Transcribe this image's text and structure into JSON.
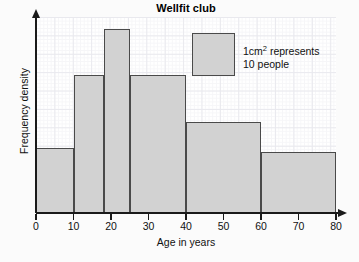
{
  "chart_data": {
    "type": "bar",
    "title": "Wellfit club",
    "xlabel": "Age in years",
    "ylabel": "Frequency density",
    "xlim": [
      0,
      80
    ],
    "ylim": [
      0,
      4.2
    ],
    "grid": true,
    "legend_position": "top-right",
    "xticks": [
      0,
      10,
      20,
      30,
      40,
      50,
      60,
      70,
      80
    ],
    "xtick_labels": [
      "0",
      "10",
      "20",
      "30",
      "40",
      "50",
      "60",
      "70",
      "80"
    ],
    "yticks": [],
    "ytick_labels": [],
    "bin_edges": [
      0,
      10,
      18,
      25,
      40,
      60,
      80
    ],
    "bin_labels": [
      "0-10",
      "10-18",
      "18-25",
      "25-40",
      "40-60",
      "60-80"
    ],
    "frequency_density": [
      1.4,
      2.95,
      3.95,
      2.95,
      1.95,
      1.3
    ],
    "bars": [
      {
        "start": 0,
        "end": 10,
        "density": 1.4
      },
      {
        "start": 10,
        "end": 18,
        "density": 2.95
      },
      {
        "start": 18,
        "end": 25,
        "density": 3.95
      },
      {
        "start": 25,
        "end": 40,
        "density": 2.95
      },
      {
        "start": 40,
        "end": 60,
        "density": 1.95
      },
      {
        "start": 60,
        "end": 80,
        "density": 1.3
      }
    ],
    "bar_fill_color": "#d2d2d2",
    "bar_edge_color": "#4a4a4a",
    "axis_color": "#1a1a1a",
    "grid_color": "#e9e9ee",
    "annotations": [
      "1cm2 represents 10 people"
    ]
  },
  "legend": {
    "line1_prefix": "1cm",
    "line1_sup": "2",
    "line1_suffix": " represents",
    "line2": "10 people"
  }
}
